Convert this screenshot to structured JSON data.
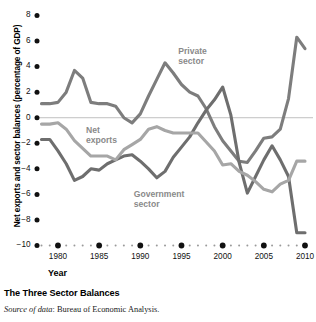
{
  "caption": {
    "title": "The Three Sector Balances",
    "source_prefix": "Source of data",
    "source_rest": ": Bureau of Economic Analysis."
  },
  "colors": {
    "private": "#7d7d7d",
    "government": "#6e6e6e",
    "net_exports": "#a6a6a6",
    "axis": "#111111",
    "zero_line": "#b9b9b9",
    "label_text": "#8a8a8a",
    "background": "#ffffff"
  },
  "labels": {
    "private": "Private\nsector",
    "net_exports": "Net\nexports",
    "government": "Government\nsector"
  },
  "chart_data": {
    "type": "line",
    "title": "The Three Sector Balances",
    "xlabel": "Year",
    "ylabel": "Net exports and sector balances (percentage of GDP)",
    "xlim": [
      1978,
      2010
    ],
    "ylim": [
      -10,
      8
    ],
    "yticks": [
      8,
      6,
      4,
      2,
      0,
      -2,
      -4,
      -6,
      -8,
      -10
    ],
    "ytick_labels": [
      "8",
      "6",
      "4",
      "2",
      "0",
      "−2",
      "−4",
      "−6",
      "−8",
      "−10"
    ],
    "xticks": [
      1980,
      1985,
      1990,
      1995,
      2000,
      2005,
      2010
    ],
    "xtick_labels": [
      "1980",
      "1985",
      "1990",
      "1995",
      "2000",
      "2005",
      "2010"
    ],
    "grid": false,
    "zero_line": true,
    "legend": "inline-annotations",
    "x": [
      1978,
      1979,
      1980,
      1981,
      1982,
      1983,
      1984,
      1985,
      1986,
      1987,
      1988,
      1989,
      1990,
      1991,
      1992,
      1993,
      1994,
      1995,
      1996,
      1997,
      1998,
      1999,
      2000,
      2001,
      2002,
      2003,
      2004,
      2005,
      2006,
      2007,
      2008,
      2009,
      2010
    ],
    "series": [
      {
        "name": "Private sector",
        "color": "#7d7d7d",
        "values": [
          1.1,
          1.1,
          1.2,
          2.0,
          3.7,
          3.1,
          1.2,
          1.1,
          1.1,
          0.9,
          0.0,
          -0.4,
          0.3,
          1.7,
          3.0,
          4.3,
          3.5,
          2.6,
          2.0,
          1.7,
          0.7,
          -0.7,
          -1.8,
          -2.6,
          -3.4,
          -3.5,
          -2.6,
          -1.6,
          -1.5,
          -0.9,
          1.5,
          6.3,
          5.4
        ]
      },
      {
        "name": "Government sector",
        "color": "#6e6e6e",
        "values": [
          -1.7,
          -1.7,
          -2.6,
          -3.6,
          -4.9,
          -4.6,
          -4.0,
          -4.1,
          -3.6,
          -3.3,
          -3.0,
          -2.9,
          -3.4,
          -4.0,
          -4.7,
          -4.2,
          -3.1,
          -2.3,
          -1.5,
          -0.4,
          0.6,
          1.4,
          2.4,
          0.2,
          -3.5,
          -5.9,
          -4.6,
          -3.3,
          -2.2,
          -3.3,
          -4.6,
          -9.0,
          -9.0
        ]
      },
      {
        "name": "Net exports",
        "color": "#a6a6a6",
        "values": [
          -0.5,
          -0.5,
          -0.4,
          -0.9,
          -1.8,
          -2.4,
          -3.0,
          -3.0,
          -3.0,
          -3.3,
          -2.5,
          -2.1,
          -1.7,
          -0.9,
          -0.7,
          -1.0,
          -1.2,
          -1.2,
          -1.2,
          -1.2,
          -1.9,
          -2.6,
          -3.7,
          -3.6,
          -4.2,
          -4.5,
          -5.0,
          -5.6,
          -5.8,
          -5.2,
          -4.9,
          -3.4,
          -3.4
        ]
      }
    ]
  }
}
